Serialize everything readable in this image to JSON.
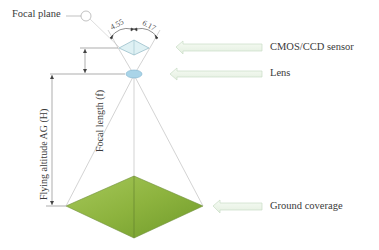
{
  "diagram": {
    "labels": {
      "focal_plane": "Focal plane",
      "sensor": "CMOS/CCD sensor",
      "lens": "Lens",
      "ground_coverage": "Ground coverage",
      "focal_length": "Focal length (f)",
      "flying_altitude": "Flying altitude AG (H)"
    },
    "dimensions": {
      "sensor_width": "4.55",
      "sensor_height": "6.17"
    },
    "colors": {
      "ground_fill": "#8db33e",
      "ground_fill_dark": "#6f9a2a",
      "sensor_fill": "#dff1f4",
      "lens_fill": "#a9d4e8",
      "arrow_fill": "#eef6ec",
      "arrow_stroke": "#c8dcc6",
      "line": "#9a9a9a"
    }
  }
}
